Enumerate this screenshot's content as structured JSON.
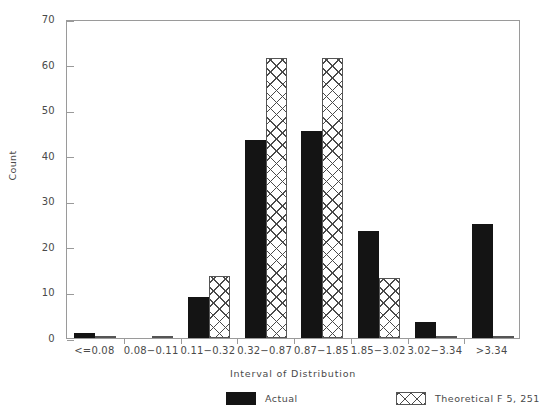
{
  "chart_data": {
    "type": "bar",
    "title": "",
    "xlabel": "Interval of Distribution",
    "ylabel": "Count",
    "ylim": [
      0,
      70
    ],
    "yticks": [
      0,
      10,
      20,
      30,
      40,
      50,
      60,
      70
    ],
    "grid": false,
    "legend_position": "bottom",
    "categories": [
      "<=0.08",
      "0.08−0.11",
      "0.11−0.32",
      "0.32−0.87",
      "0.87−1.85",
      "1.85−3.02",
      "3.02−3.34",
      ">3.34"
    ],
    "series": [
      {
        "name": "Actual",
        "pattern": "solid",
        "color": "#141414",
        "values": [
          1,
          0,
          9,
          43.5,
          45.5,
          23.5,
          3.5,
          25
        ]
      },
      {
        "name": "Theoretical F 5, 251",
        "pattern": "cross-hatch",
        "color": "#4a4a4a",
        "values": [
          0.3,
          0.3,
          13.5,
          61.5,
          61.5,
          13.2,
          0.3,
          0.3
        ]
      }
    ]
  },
  "axes": {
    "y_title": "Count",
    "x_title": "Interval of Distribution",
    "y_tick_labels": [
      "0",
      "10",
      "20",
      "30",
      "40",
      "50",
      "60",
      "70"
    ]
  },
  "legend": {
    "entries": [
      {
        "label": "Actual"
      },
      {
        "label": "Theoretical F 5, 251"
      }
    ]
  }
}
